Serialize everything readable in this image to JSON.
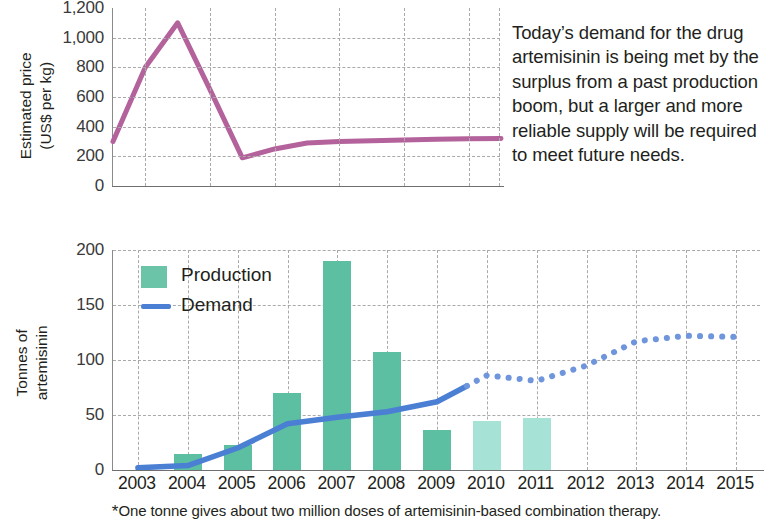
{
  "blurb": "Today’s demand for the drug artemisinin is being met by the surplus from a past production boom, but a larger and more reliable supply will be required to meet future needs.",
  "footnote": {
    "marker": "*",
    "text": "One tonne gives about two million doses of artemisinin-based combination therapy."
  },
  "colors": {
    "price_line": "#b3629b",
    "production_bar": "#5cbfa2",
    "production_bar_projected": "#a6e3d6",
    "demand_line": "#4a7fd4",
    "demand_line_projected": "#6f96dd",
    "grid": "#a9a9a9",
    "axis": "#6f6f6f",
    "text": "#231f20"
  },
  "chart_data": [
    {
      "type": "line",
      "id": "estimated-price",
      "title": "",
      "ylabel": "Estimated price\n(US$ per kg)",
      "ylabel_lines": [
        "Estimated price",
        "(US$ per kg)"
      ],
      "xlabel": "",
      "ylim": [
        0,
        1200
      ],
      "yticks": [
        0,
        200,
        400,
        600,
        800,
        1000,
        1200
      ],
      "ytick_labels": [
        "0",
        "200",
        "400",
        "600",
        "800",
        "1,000",
        "1,200"
      ],
      "xlim": [
        2003,
        2015
      ],
      "grid": true,
      "grid_x_years": [
        2004,
        2006,
        2008,
        2010,
        2012,
        2014,
        2015
      ],
      "legend": "none",
      "series": [
        {
          "name": "Estimated price",
          "color": "#b3629b",
          "x": [
            2003,
            2004,
            2005,
            2006,
            2007,
            2008,
            2009,
            2010,
            2011,
            2012,
            2013,
            2014,
            2015
          ],
          "values": [
            300,
            800,
            1100,
            650,
            190,
            250,
            290,
            300,
            305,
            310,
            315,
            318,
            320
          ]
        }
      ]
    },
    {
      "type": "bar+line",
      "id": "tonnes-of-artemisinin",
      "title": "",
      "ylabel": "Tonnes of\nartemisinin",
      "ylabel_lines": [
        "Tonnes of",
        "artemisinin"
      ],
      "xlabel": "",
      "ylim": [
        0,
        200
      ],
      "yticks": [
        0,
        50,
        100,
        150,
        200
      ],
      "ytick_labels": [
        "0",
        "50",
        "100",
        "150",
        "200"
      ],
      "categories": [
        2003,
        2004,
        2005,
        2006,
        2007,
        2008,
        2009,
        2010,
        2011,
        2012,
        2013,
        2014,
        2015
      ],
      "xtick_labels": [
        "2003",
        "2004",
        "2005",
        "2006",
        "2007",
        "2008",
        "2009",
        "2010",
        "2011",
        "2012",
        "2013",
        "2014",
        "2015"
      ],
      "grid": true,
      "legend": {
        "position": "top-left",
        "entries": [
          {
            "label": "Production",
            "marker": "bar",
            "color": "#5cbfa2"
          },
          {
            "label": "Demand",
            "marker": "line",
            "color": "#4a7fd4"
          }
        ]
      },
      "series": [
        {
          "name": "Production",
          "type": "bar",
          "color": "#5cbfa2",
          "projected_color": "#a6e3d6",
          "x": [
            2003,
            2004,
            2005,
            2006,
            2007,
            2008,
            2009,
            2010,
            2011
          ],
          "values": [
            0,
            15,
            23,
            70,
            190,
            107,
            36,
            45,
            47
          ],
          "projected_from": 2010
        },
        {
          "name": "Demand",
          "type": "line",
          "color": "#4a7fd4",
          "x": [
            2003,
            2004,
            2005,
            2006,
            2007,
            2008,
            2009,
            2010,
            2011,
            2012,
            2013,
            2014,
            2015
          ],
          "values": [
            2,
            4,
            20,
            42,
            48,
            53,
            62,
            86,
            81,
            95,
            117,
            122,
            121
          ],
          "dashed_from": 2009.6
        }
      ]
    }
  ]
}
